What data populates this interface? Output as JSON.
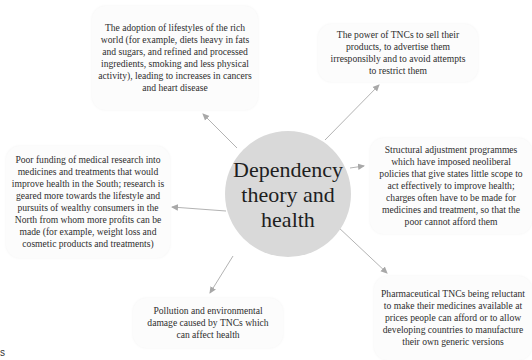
{
  "diagram": {
    "center": {
      "label": "Dependency theory and health",
      "fill": "#d9d9d9"
    },
    "arrow_color": "#a8a8a8",
    "nodes": [
      {
        "id": "lifestyles",
        "text": "The adoption of lifestyles of the rich world (for example, diets heavy in fats and sugars, and refined and processed ingredients, smoking and less physical activity), leading to increases in cancers and heart disease"
      },
      {
        "id": "tnc-power",
        "text": "The power of TNCs to sell their products, to advertise them irresponsibly and to avoid attempts to restrict them"
      },
      {
        "id": "structural-adjustment",
        "text": "Structural adjustment programmes which have imposed neoliberal policies that give states little scope to act effectively to improve health; charges often have to be made for medicines and treatment, so that the poor cannot afford them"
      },
      {
        "id": "pharma-tncs",
        "text": "Pharmaceutical TNCs being reluctant to make their medicines available at prices people can afford or to allow developing countries to manufacture their own generic versions"
      },
      {
        "id": "pollution",
        "text": "Pollution and environmental damage caused by TNCs which can affect health"
      },
      {
        "id": "research-funding",
        "text": "Poor funding of medical research into medicines and treatments that would improve health in the South; research is geared more towards the lifestyle and pursuits of wealthy consumers in the North from whom more profits can be made (for example, weight loss and cosmetic products and treatments)"
      }
    ],
    "corner_fragment": "s"
  }
}
